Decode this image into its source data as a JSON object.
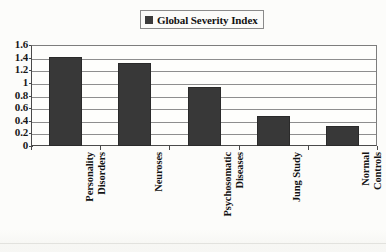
{
  "legend": {
    "label": "Global Severity Index",
    "swatch_color": "#383838",
    "position": "top-center",
    "boxed": true
  },
  "axis": {
    "y_ticks": [
      "1.6",
      "1.4",
      "1.2",
      "1",
      "0.8",
      "0.6",
      "0.4",
      "0.2",
      "0"
    ]
  },
  "categories": [
    {
      "line1": "Personality",
      "line2": "Disorders",
      "full": "Personality Disorders"
    },
    {
      "line1": "Neuroses",
      "line2": "",
      "full": "Neuroses"
    },
    {
      "line1": "Psychosomatic",
      "line2": "Diseases",
      "full": "Psychosomatic Diseases"
    },
    {
      "line1": "Jung Study",
      "line2": "",
      "full": "Jung Study"
    },
    {
      "line1": "Normal",
      "line2": "Controls",
      "full": "Normal Controls"
    }
  ],
  "chart_data": {
    "type": "bar",
    "title": "",
    "subtitle": "",
    "xlabel": "",
    "ylabel": "",
    "ylim": [
      0,
      1.6
    ],
    "ytick_step": 0.2,
    "yticks": [
      0,
      0.2,
      0.4,
      0.6,
      0.8,
      1,
      1.2,
      1.4,
      1.6
    ],
    "grid": "horizontal",
    "legend_position": "top-center",
    "bar_color": "#383838",
    "categories": [
      "Personality Disorders",
      "Neuroses",
      "Psychosomatic Diseases",
      "Jung Study",
      "Normal Controls"
    ],
    "series": [
      {
        "name": "Global Severity Index",
        "values": [
          1.41,
          1.31,
          0.93,
          0.48,
          0.32
        ]
      }
    ]
  }
}
